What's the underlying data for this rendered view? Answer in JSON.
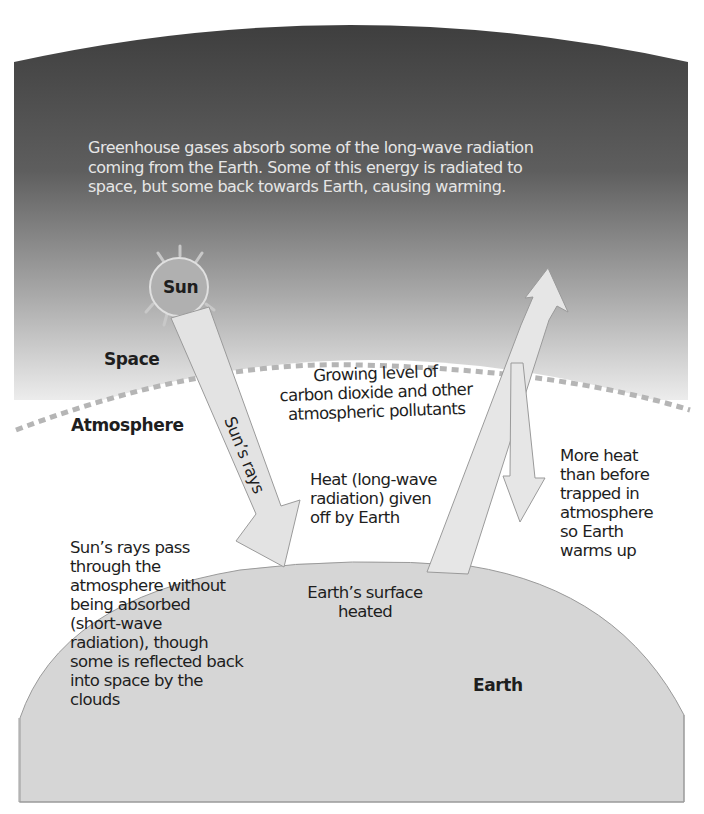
{
  "caption": {
    "lines": [
      "Greenhouse gases absorb some of the long-wave radiation",
      "coming from the Earth. Some of this energy is radiated to",
      "space, but some back towards Earth, causing warming."
    ]
  },
  "labels": {
    "sun": "Sun",
    "space": "Space",
    "atmosphere": "Atmosphere",
    "earth": "Earth",
    "suns_rays_arrow": "Sun’s rays"
  },
  "annotations": {
    "pollutants": [
      "Growing level of",
      "carbon dioxide and other",
      "atmospheric pollutants"
    ],
    "heat_given_off": [
      "Heat (long-wave",
      "radiation) given",
      "off by Earth"
    ],
    "more_heat": [
      "More heat",
      "than before",
      "trapped in",
      "atmosphere",
      "so Earth",
      "warms up"
    ],
    "suns_rays_pass": [
      "Sun’s rays pass",
      "through the",
      "atmosphere without",
      "being absorbed",
      "(short-wave",
      "radiation), though",
      "some is reflected back",
      "into space by the",
      "clouds"
    ],
    "surface_heated": [
      "Earth’s surface",
      "heated"
    ]
  },
  "colors": {
    "space_dark": "#3a3a3a",
    "space_light": "#ffffff",
    "earth_fill": "#d6d6d6",
    "arrow_fill": "#e3e3e3",
    "arrow_stroke": "#9a9a9a",
    "dash_line": "#b5b5b5",
    "sun_fill": "#b0b0b0",
    "caption_text": "#e6e6e6"
  }
}
